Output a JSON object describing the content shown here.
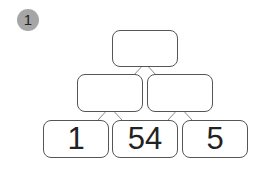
{
  "exercise_number": "1",
  "pyramid": {
    "top": [
      ""
    ],
    "middle": [
      "",
      ""
    ],
    "bottom": [
      "1",
      "54",
      "5"
    ]
  }
}
